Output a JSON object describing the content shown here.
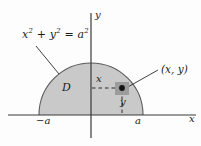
{
  "figure": {
    "type": "math-diagram",
    "background_color": "#fdfdfd",
    "region_fill_color": "#c9c9c9",
    "curve_color": "#555555",
    "axis_color": "#3a3a3a",
    "point_color": "#1a1a1a",
    "point_halo_color": "#9a9a9a",
    "labels": {
      "equation_x": "x",
      "equation_x_exp": "2",
      "equation_plus": " + ",
      "equation_y": "y",
      "equation_y_exp": "2",
      "equation_equals": " = ",
      "equation_a": "a",
      "equation_a_exp": "2",
      "region": "D",
      "point": "(x, y)",
      "x_dimension": "x",
      "y_dimension": "y",
      "x_axis": "x",
      "y_axis": "y",
      "tick_left": "−a",
      "tick_right": "a"
    }
  },
  "geometry": {
    "origin_x": 91,
    "baseline_y": 115,
    "radius": 52,
    "semicircle_left_x": 39,
    "semicircle_right_x": 143,
    "semicircle_top_y": 63,
    "point_x": 122,
    "point_y": 89,
    "x_axis_start": 8,
    "x_axis_end": 196,
    "y_axis_top": 13,
    "y_axis_bottom": 138
  }
}
